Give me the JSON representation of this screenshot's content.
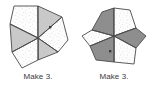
{
  "page": {
    "background_color": "#ffffff",
    "width": 152,
    "height": 96
  },
  "palette": {
    "outline": "#4a4a4a",
    "light_fill": "#fdfdfd",
    "light_speckle": "#b9b9b9",
    "mid_gray_fill": "#c9c9c9",
    "dark_gray_fill": "#8e8e8e",
    "caption_color": "#3a3a3a"
  },
  "figures": [
    {
      "id": "figure-left",
      "name": "hexagon-six-wedges-left",
      "caption": "Make 3.",
      "sector_count": 6,
      "dot_marker": true,
      "wedges": [
        {
          "index": 0,
          "position": "upper-left",
          "fill": "light"
        },
        {
          "index": 1,
          "position": "upper-right",
          "fill": "gray"
        },
        {
          "index": 2,
          "position": "right",
          "fill": "light"
        },
        {
          "index": 3,
          "position": "lower-right",
          "fill": "gray"
        },
        {
          "index": 4,
          "position": "lower-left",
          "fill": "light"
        },
        {
          "index": 5,
          "position": "left",
          "fill": "gray"
        }
      ]
    },
    {
      "id": "figure-right",
      "name": "hexagon-six-wedges-right",
      "caption": "Make 3.",
      "sector_count": 6,
      "dot_marker": true,
      "wedges": [
        {
          "index": 0,
          "position": "upper-left",
          "fill": "gray"
        },
        {
          "index": 1,
          "position": "upper-right",
          "fill": "light"
        },
        {
          "index": 2,
          "position": "right",
          "fill": "gray"
        },
        {
          "index": 3,
          "position": "lower-right",
          "fill": "light"
        },
        {
          "index": 4,
          "position": "lower-left",
          "fill": "gray"
        },
        {
          "index": 5,
          "position": "left",
          "fill": "light"
        }
      ]
    }
  ]
}
